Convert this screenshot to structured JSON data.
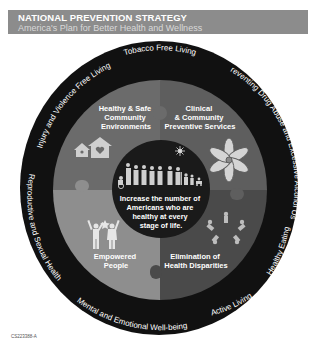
{
  "header": {
    "title": "NATIONAL PREVENTION STRATEGY",
    "subtitle": "America's Plan for Better Health and Wellness"
  },
  "outer_ring": {
    "color": "#111111",
    "labels": [
      "Tobacco Free Living",
      "Preventing Drug Abuse and Excessive Alcohol Use",
      "Healthy Eating",
      "Active Living",
      "Mental and Emotional Well-being",
      "Reproductive and Sexual Health",
      "Injury and Violence Free Living"
    ]
  },
  "quadrants": [
    {
      "id": "top-left",
      "label_lines": [
        "Healthy & Safe",
        "Community",
        "Environments"
      ],
      "icon": "houses-heart-icon",
      "color": "#6b6b6b"
    },
    {
      "id": "top-right",
      "label_lines": [
        "Clinical",
        "& Community",
        "Preventive Services"
      ],
      "icon": "linked-hands-flower-icon",
      "color": "#5e5e5e"
    },
    {
      "id": "bottom-left",
      "label_lines": [
        "Empowered",
        "People"
      ],
      "icon": "people-reaching-star-icon",
      "color": "#8e8e8e"
    },
    {
      "id": "bottom-right",
      "label_lines": [
        "Elimination of",
        "Health Disparities"
      ],
      "icon": "people-circle-icon",
      "color": "#4a4a4a"
    }
  ],
  "center": {
    "color": "#1a1a1a",
    "icon": "family-lifespan-icon",
    "text_lines": [
      "Increase the number of",
      "Americans who are",
      "healthy at every",
      "stage of life."
    ]
  },
  "footer": {
    "code": "CS223388-A"
  }
}
